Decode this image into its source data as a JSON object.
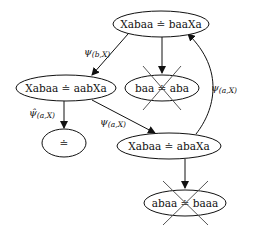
{
  "diagram": {
    "nodes": [
      {
        "id": "n1",
        "label": "Xabaa ≐ baaXa",
        "crossed": false
      },
      {
        "id": "n2",
        "label": "Xabaa ≐ aabXa",
        "crossed": false
      },
      {
        "id": "n3",
        "label": "baa ≐ aba",
        "crossed": true
      },
      {
        "id": "n4",
        "label": "≐",
        "crossed": false
      },
      {
        "id": "n5",
        "label": "Xabaa ≐ abaXa",
        "crossed": false
      },
      {
        "id": "n6",
        "label": "abaa ≐ baaa",
        "crossed": true
      }
    ],
    "edges": [
      {
        "from": "n1",
        "to": "n2",
        "label_main": "ψ",
        "label_sub": "(b,X)"
      },
      {
        "from": "n1",
        "to": "n3",
        "label_main": "",
        "label_sub": ""
      },
      {
        "from": "n2",
        "to": "n4",
        "label_main": "ψ̂",
        "label_sub": "(a,X)"
      },
      {
        "from": "n2",
        "to": "n5",
        "label_main": "ψ",
        "label_sub": "(a,X)"
      },
      {
        "from": "n5",
        "to": "n1",
        "label_main": "ψ",
        "label_sub": "(a,X)"
      },
      {
        "from": "n5",
        "to": "n6",
        "label_main": "",
        "label_sub": ""
      }
    ]
  }
}
